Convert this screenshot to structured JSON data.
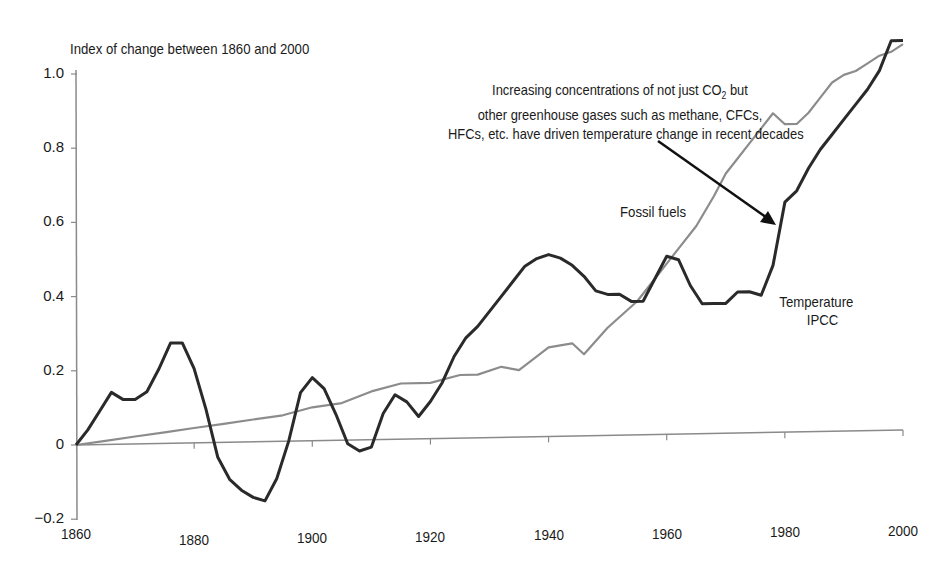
{
  "chart_data": {
    "type": "line",
    "title": "",
    "ylabel": "Index of change between 1860 and 2000",
    "xlabel": "",
    "xlim": [
      1860,
      2000
    ],
    "ylim": [
      -0.2,
      1.0
    ],
    "grid": false,
    "legend_position": "inline labels",
    "x_ticks": [
      "1860",
      "1880",
      "1900",
      "1920",
      "1940",
      "1960",
      "1980",
      "2000"
    ],
    "y_ticks": [
      "−0.2",
      "0",
      "0.2",
      "0.4",
      "0.6",
      "0.8",
      "1.0"
    ],
    "series": [
      {
        "name": "Temperature IPCC",
        "label_lines": [
          "Temperature",
          "IPCC"
        ],
        "color": "#2a2a2a",
        "x": [
          1860,
          1862,
          1864,
          1866,
          1868,
          1870,
          1872,
          1874,
          1876,
          1878,
          1880,
          1882,
          1884,
          1886,
          1888,
          1890,
          1892,
          1894,
          1896,
          1898,
          1900,
          1902,
          1904,
          1906,
          1908,
          1910,
          1912,
          1914,
          1916,
          1918,
          1920,
          1922,
          1924,
          1926,
          1928,
          1930,
          1932,
          1934,
          1936,
          1938,
          1940,
          1942,
          1944,
          1946,
          1948,
          1950,
          1952,
          1954,
          1956,
          1958,
          1960,
          1962,
          1964,
          1966,
          1968,
          1970,
          1972,
          1974,
          1976,
          1978,
          1980,
          1982,
          1984,
          1986,
          1988,
          1990,
          1992,
          1994,
          1996,
          1998,
          2000
        ],
        "values": [
          0.0,
          0.04,
          0.09,
          0.14,
          0.12,
          0.12,
          0.14,
          0.2,
          0.27,
          0.27,
          0.2,
          0.09,
          -0.04,
          -0.1,
          -0.13,
          -0.15,
          -0.16,
          -0.1,
          0.0,
          0.13,
          0.17,
          0.14,
          0.07,
          -0.01,
          -0.03,
          -0.02,
          0.07,
          0.12,
          0.1,
          0.06,
          0.1,
          0.15,
          0.22,
          0.27,
          0.3,
          0.34,
          0.38,
          0.42,
          0.46,
          0.48,
          0.49,
          0.48,
          0.46,
          0.43,
          0.39,
          0.38,
          0.38,
          0.36,
          0.36,
          0.42,
          0.48,
          0.47,
          0.4,
          0.35,
          0.35,
          0.35,
          0.38,
          0.38,
          0.37,
          0.45,
          0.62,
          0.65,
          0.71,
          0.76,
          0.8,
          0.84,
          0.88,
          0.92,
          0.97,
          1.05,
          1.05
        ]
      },
      {
        "name": "Fossil fuels",
        "label_lines": [
          "Fossil fuels"
        ],
        "color": "#8c8c8c",
        "x": [
          1860,
          1865,
          1870,
          1875,
          1880,
          1885,
          1890,
          1895,
          1900,
          1905,
          1910,
          1915,
          1920,
          1925,
          1928,
          1932,
          1935,
          1940,
          1944,
          1946,
          1950,
          1955,
          1958,
          1960,
          1962,
          1965,
          1968,
          1970,
          1972,
          1974,
          1976,
          1978,
          1980,
          1982,
          1984,
          1986,
          1988,
          1990,
          1992,
          1994,
          1996,
          1998,
          2000
        ],
        "values": [
          0.0,
          0.01,
          0.02,
          0.03,
          0.04,
          0.05,
          0.06,
          0.07,
          0.09,
          0.1,
          0.13,
          0.15,
          0.15,
          0.17,
          0.17,
          0.19,
          0.18,
          0.24,
          0.25,
          0.22,
          0.29,
          0.36,
          0.42,
          0.46,
          0.5,
          0.56,
          0.64,
          0.7,
          0.74,
          0.78,
          0.82,
          0.86,
          0.83,
          0.83,
          0.86,
          0.9,
          0.94,
          0.96,
          0.97,
          0.99,
          1.01,
          1.02,
          1.04
        ]
      }
    ],
    "annotations": [
      {
        "lines": [
          "Increasing concentrations of not just CO",
          "2",
          " but",
          "other greenhouse gases such as methane, CFCs,",
          "HFCs, etc. have driven temperature change in recent decades"
        ],
        "arrow_target": {
          "x": 1978,
          "y": 0.6
        }
      }
    ]
  },
  "labels": {
    "y_axis_title": "Index of change between 1860 and 2000",
    "annotation_line1_pre": "Increasing concentrations of not just CO",
    "annotation_line1_sub": "2",
    "annotation_line1_post": " but",
    "annotation_line2": "other greenhouse gases such as methane, CFCs,",
    "annotation_line3": "HFCs, etc. have driven temperature change in recent decades",
    "fossil_label": "Fossil fuels",
    "temp_label_1": "Temperature",
    "temp_label_2": "IPCC"
  }
}
